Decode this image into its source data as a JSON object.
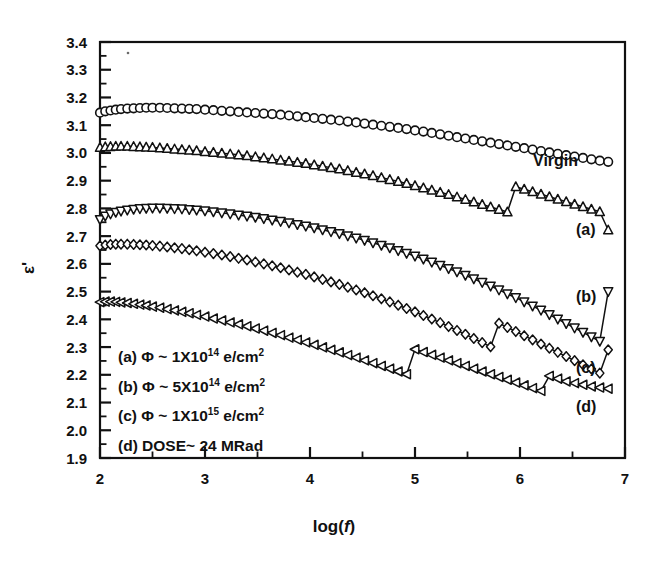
{
  "figure": {
    "background": "#ffffff",
    "ink": "#111111"
  },
  "axes": {
    "y_title": "ε'",
    "x_title_prefix": "log(",
    "x_title_var": "f",
    "x_title_suffix": ")",
    "y_ticks": [
      "3.4",
      "3.3",
      "3.2",
      "3.1",
      "3.0",
      "2.9",
      "2.8",
      "2.7",
      "2.6",
      "2.5",
      "2.4",
      "2.3",
      "2.2",
      "2.1",
      "2.0",
      "1.9"
    ],
    "x_ticks": [
      "2",
      "3",
      "4",
      "5",
      "6",
      "7"
    ]
  },
  "legend": {
    "items": [
      {
        "key": "(a)",
        "phi": "Φ ~ 1X10",
        "exp": "14",
        "unit": " e/cm",
        "unit_exp": "2"
      },
      {
        "key": "(b)",
        "phi": "Φ ~ 5X10",
        "exp": "14",
        "unit": " e/cm",
        "unit_exp": "2"
      },
      {
        "key": "(c)",
        "phi": "Φ ~ 1X10",
        "exp": "15",
        "unit": " e/cm",
        "unit_exp": "2"
      },
      {
        "key": "(d)",
        "phi": "DOSE~ 24 MRad",
        "exp": "",
        "unit": "",
        "unit_exp": ""
      }
    ]
  },
  "series_labels": {
    "virgin": "Virgin",
    "a": "(a)",
    "b": "(b)",
    "c": "(c)",
    "d": "(d)"
  },
  "chart_data": {
    "type": "scatter",
    "title": "",
    "xlabel": "log(f)",
    "ylabel": "ε'",
    "xlim": [
      2,
      7
    ],
    "ylim": [
      1.9,
      3.4
    ],
    "grid": false,
    "legend_position": "inside-bottom-left",
    "marker_styles": {
      "Virgin": "circle",
      "(a)": "triangle-up",
      "(b)": "triangle-down",
      "(c)": "diamond",
      "(d)": "triangle-left"
    },
    "series": [
      {
        "name": "Virgin",
        "label": "Virgin",
        "marker": "circle",
        "x": [
          2.0,
          2.05,
          2.1,
          2.15,
          2.2,
          2.26,
          2.32,
          2.38,
          2.44,
          2.5,
          2.57,
          2.64,
          2.71,
          2.78,
          2.85,
          2.92,
          3.0,
          3.08,
          3.16,
          3.24,
          3.32,
          3.4,
          3.48,
          3.56,
          3.64,
          3.72,
          3.8,
          3.88,
          3.96,
          4.04,
          4.12,
          4.2,
          4.28,
          4.36,
          4.44,
          4.52,
          4.6,
          4.68,
          4.76,
          4.84,
          4.92,
          5.0,
          5.08,
          5.16,
          5.24,
          5.32,
          5.4,
          5.48,
          5.56,
          5.64,
          5.72,
          5.8,
          5.88,
          5.96,
          6.04,
          6.12,
          6.2,
          6.28,
          6.36,
          6.44,
          6.52,
          6.6,
          6.68,
          6.76,
          6.84
        ],
        "y": [
          3.145,
          3.15,
          3.153,
          3.156,
          3.158,
          3.16,
          3.161,
          3.162,
          3.163,
          3.163,
          3.163,
          3.162,
          3.161,
          3.16,
          3.159,
          3.158,
          3.156,
          3.154,
          3.152,
          3.15,
          3.148,
          3.146,
          3.144,
          3.142,
          3.14,
          3.138,
          3.135,
          3.132,
          3.129,
          3.126,
          3.123,
          3.12,
          3.117,
          3.113,
          3.11,
          3.106,
          3.102,
          3.098,
          3.094,
          3.09,
          3.086,
          3.081,
          3.077,
          3.072,
          3.067,
          3.062,
          3.057,
          3.052,
          3.047,
          3.042,
          3.037,
          3.032,
          3.027,
          3.022,
          3.017,
          3.012,
          3.007,
          3.002,
          2.997,
          2.992,
          2.987,
          2.982,
          2.977,
          2.972,
          2.968
        ]
      },
      {
        "name": "(a)",
        "label": "(a)",
        "marker": "triangle-up",
        "x": [
          2.0,
          2.05,
          2.1,
          2.15,
          2.2,
          2.26,
          2.32,
          2.38,
          2.44,
          2.5,
          2.57,
          2.64,
          2.71,
          2.78,
          2.85,
          2.92,
          3.0,
          3.08,
          3.16,
          3.24,
          3.32,
          3.4,
          3.48,
          3.56,
          3.64,
          3.72,
          3.8,
          3.88,
          3.96,
          4.04,
          4.12,
          4.2,
          4.28,
          4.36,
          4.44,
          4.52,
          4.6,
          4.68,
          4.76,
          4.84,
          4.92,
          5.0,
          5.08,
          5.16,
          5.24,
          5.32,
          5.4,
          5.48,
          5.56,
          5.64,
          5.72,
          5.8,
          5.88,
          5.96,
          6.04,
          6.12,
          6.2,
          6.28,
          6.36,
          6.44,
          6.52,
          6.6,
          6.68,
          6.76,
          6.84
        ],
        "y": [
          3.02,
          3.022,
          3.023,
          3.024,
          3.024,
          3.024,
          3.023,
          3.022,
          3.021,
          3.02,
          3.018,
          3.016,
          3.014,
          3.012,
          3.01,
          3.008,
          3.005,
          3.002,
          2.999,
          2.996,
          2.993,
          2.99,
          2.986,
          2.982,
          2.978,
          2.974,
          2.97,
          2.966,
          2.962,
          2.957,
          2.952,
          2.947,
          2.942,
          2.936,
          2.93,
          2.924,
          2.918,
          2.911,
          2.904,
          2.897,
          2.89,
          2.882,
          2.874,
          2.866,
          2.858,
          2.85,
          2.841,
          2.832,
          2.823,
          2.814,
          2.805,
          2.796,
          2.787,
          2.878,
          2.869,
          2.86,
          2.851,
          2.842,
          2.833,
          2.824,
          2.815,
          2.806,
          2.797,
          2.788,
          2.722
        ]
      },
      {
        "name": "(b)",
        "label": "(b)",
        "marker": "triangle-down",
        "x": [
          2.0,
          2.05,
          2.1,
          2.15,
          2.2,
          2.26,
          2.32,
          2.38,
          2.44,
          2.5,
          2.57,
          2.64,
          2.71,
          2.78,
          2.85,
          2.92,
          3.0,
          3.08,
          3.16,
          3.24,
          3.32,
          3.4,
          3.48,
          3.56,
          3.64,
          3.72,
          3.8,
          3.88,
          3.96,
          4.04,
          4.12,
          4.2,
          4.28,
          4.36,
          4.44,
          4.52,
          4.6,
          4.68,
          4.76,
          4.84,
          4.92,
          5.0,
          5.08,
          5.16,
          5.24,
          5.32,
          5.4,
          5.48,
          5.56,
          5.64,
          5.72,
          5.8,
          5.88,
          5.96,
          6.04,
          6.12,
          6.2,
          6.28,
          6.36,
          6.44,
          6.52,
          6.6,
          6.68,
          6.76,
          6.84
        ],
        "y": [
          2.76,
          2.772,
          2.78,
          2.786,
          2.79,
          2.794,
          2.797,
          2.799,
          2.8,
          2.801,
          2.801,
          2.8,
          2.799,
          2.798,
          2.796,
          2.794,
          2.791,
          2.788,
          2.784,
          2.78,
          2.776,
          2.772,
          2.768,
          2.763,
          2.758,
          2.753,
          2.748,
          2.742,
          2.736,
          2.73,
          2.723,
          2.716,
          2.709,
          2.701,
          2.693,
          2.685,
          2.676,
          2.667,
          2.658,
          2.648,
          2.638,
          2.628,
          2.617,
          2.606,
          2.595,
          2.583,
          2.571,
          2.559,
          2.546,
          2.533,
          2.52,
          2.506,
          2.492,
          2.478,
          2.463,
          2.448,
          2.433,
          2.417,
          2.401,
          2.385,
          2.369,
          2.353,
          2.337,
          2.321,
          2.5
        ]
      },
      {
        "name": "(c)",
        "label": "(c)",
        "marker": "diamond",
        "x": [
          2.0,
          2.05,
          2.1,
          2.15,
          2.2,
          2.26,
          2.32,
          2.38,
          2.44,
          2.5,
          2.57,
          2.64,
          2.71,
          2.78,
          2.85,
          2.92,
          3.0,
          3.08,
          3.16,
          3.24,
          3.32,
          3.4,
          3.48,
          3.56,
          3.64,
          3.72,
          3.8,
          3.88,
          3.96,
          4.04,
          4.12,
          4.2,
          4.28,
          4.36,
          4.44,
          4.52,
          4.6,
          4.68,
          4.76,
          4.84,
          4.92,
          5.0,
          5.08,
          5.16,
          5.24,
          5.32,
          5.4,
          5.48,
          5.56,
          5.64,
          5.72,
          5.8,
          5.88,
          5.96,
          6.04,
          6.12,
          6.2,
          6.28,
          6.36,
          6.44,
          6.52,
          6.6,
          6.68,
          6.76,
          6.84
        ],
        "y": [
          2.665,
          2.668,
          2.67,
          2.671,
          2.671,
          2.671,
          2.67,
          2.669,
          2.668,
          2.666,
          2.664,
          2.661,
          2.658,
          2.655,
          2.651,
          2.647,
          2.642,
          2.637,
          2.632,
          2.626,
          2.62,
          2.614,
          2.607,
          2.6,
          2.593,
          2.586,
          2.578,
          2.57,
          2.562,
          2.553,
          2.544,
          2.535,
          2.526,
          2.516,
          2.506,
          2.496,
          2.485,
          2.474,
          2.463,
          2.451,
          2.439,
          2.427,
          2.414,
          2.401,
          2.388,
          2.374,
          2.36,
          2.346,
          2.331,
          2.316,
          2.301,
          2.386,
          2.371,
          2.356,
          2.341,
          2.326,
          2.311,
          2.296,
          2.281,
          2.266,
          2.251,
          2.236,
          2.221,
          2.206,
          2.29
        ]
      },
      {
        "name": "(d)",
        "label": "(d)",
        "marker": "triangle-left",
        "x": [
          2.0,
          2.05,
          2.1,
          2.15,
          2.2,
          2.26,
          2.32,
          2.38,
          2.44,
          2.5,
          2.57,
          2.64,
          2.71,
          2.78,
          2.85,
          2.92,
          3.0,
          3.08,
          3.16,
          3.24,
          3.32,
          3.4,
          3.48,
          3.56,
          3.64,
          3.72,
          3.8,
          3.88,
          3.96,
          4.04,
          4.12,
          4.2,
          4.28,
          4.36,
          4.44,
          4.52,
          4.6,
          4.68,
          4.76,
          4.84,
          4.92,
          5.0,
          5.08,
          5.16,
          5.24,
          5.32,
          5.4,
          5.48,
          5.56,
          5.64,
          5.72,
          5.8,
          5.88,
          5.96,
          6.04,
          6.12,
          6.2,
          6.28,
          6.36,
          6.44,
          6.52,
          6.6,
          6.68,
          6.76,
          6.84
        ],
        "y": [
          2.462,
          2.464,
          2.464,
          2.463,
          2.461,
          2.459,
          2.456,
          2.453,
          2.45,
          2.446,
          2.442,
          2.437,
          2.432,
          2.427,
          2.422,
          2.416,
          2.41,
          2.403,
          2.396,
          2.389,
          2.382,
          2.375,
          2.367,
          2.359,
          2.351,
          2.343,
          2.334,
          2.326,
          2.317,
          2.308,
          2.299,
          2.29,
          2.281,
          2.271,
          2.262,
          2.252,
          2.242,
          2.232,
          2.222,
          2.212,
          2.202,
          2.292,
          2.282,
          2.272,
          2.262,
          2.252,
          2.242,
          2.232,
          2.222,
          2.212,
          2.202,
          2.192,
          2.182,
          2.172,
          2.162,
          2.152,
          2.142,
          2.196,
          2.186,
          2.176,
          2.17,
          2.164,
          2.158,
          2.154,
          2.15
        ]
      }
    ]
  }
}
